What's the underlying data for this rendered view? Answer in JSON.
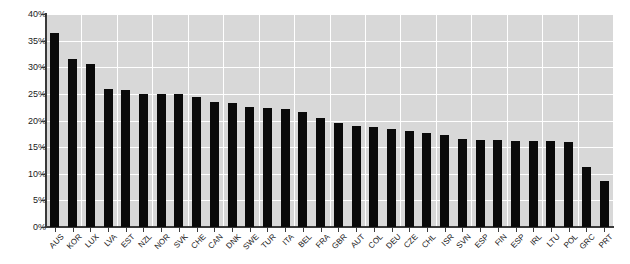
{
  "chart_data": {
    "type": "bar",
    "title": "",
    "subtitle": "",
    "xlabel": "",
    "ylabel": "",
    "ylim": [
      0,
      40
    ],
    "ytick_labels": [
      "0%",
      "5%",
      "10%",
      "15%",
      "20%",
      "25%",
      "30%",
      "35%",
      "40%"
    ],
    "ytick_values": [
      0,
      5,
      10,
      15,
      20,
      25,
      30,
      35,
      40
    ],
    "grid": true,
    "legend": "none",
    "bar_color": "#0a0a0a",
    "plot_background": "#d8d8d8",
    "gridline_color": "#ffffff",
    "categories": [
      "AUS",
      "KOR",
      "LUX",
      "LVA",
      "EST",
      "NZL",
      "NOR",
      "SVK",
      "CHE",
      "CAN",
      "DNK",
      "SWE",
      "TUR",
      "ITA",
      "BEL",
      "FRA",
      "GBR",
      "AUT",
      "COL",
      "DEU",
      "CZE",
      "CHL",
      "ISR",
      "SVN",
      "ESP",
      "FIN",
      "ESP",
      "IRL",
      "LTU",
      "POL",
      "GRC",
      "PRT"
    ],
    "values": [
      36.5,
      31.5,
      30.6,
      26.0,
      25.8,
      25.0,
      25.0,
      25.0,
      24.4,
      23.4,
      23.2,
      22.6,
      22.4,
      22.2,
      21.6,
      20.4,
      19.6,
      19.0,
      18.8,
      18.4,
      18.0,
      17.6,
      17.2,
      16.6,
      16.4,
      16.3,
      16.2,
      16.2,
      16.1,
      16.0,
      11.2,
      8.6
    ]
  }
}
